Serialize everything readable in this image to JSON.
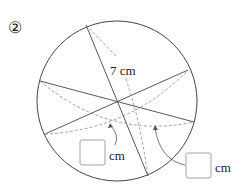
{
  "problem_number": "②",
  "diameter_label": "7 cm",
  "answer_blanks": [
    {
      "unit": "cm",
      "value": ""
    },
    {
      "unit": "cm",
      "value": ""
    }
  ],
  "colors": {
    "line": "#444444",
    "dashed": "#888888",
    "box": "#999999"
  }
}
